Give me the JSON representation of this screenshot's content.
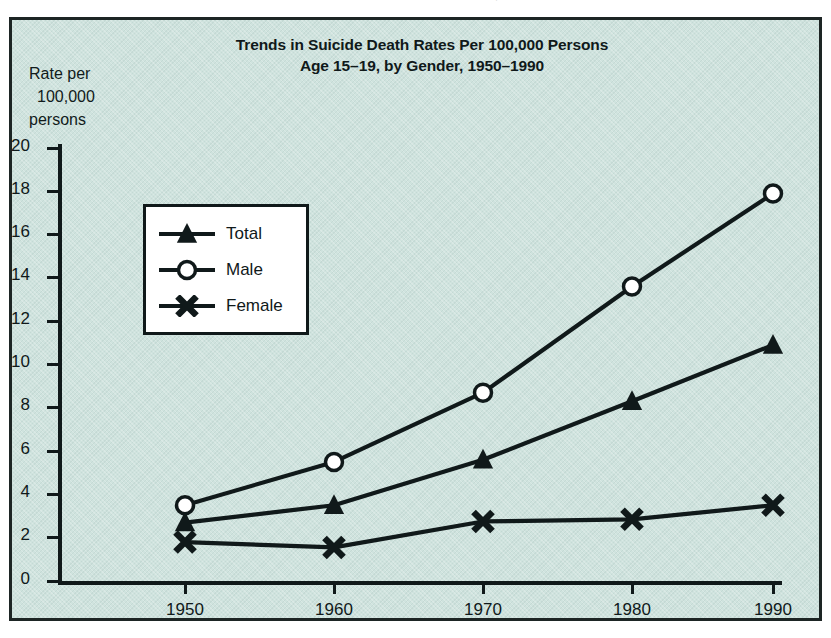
{
  "scan_artifact": {
    "ghost_text": "Trends in Suicide Death Rates Per 100,000 Persons"
  },
  "chart_panel": {
    "background_color": "#cfe3de",
    "border_color": "#1d2524",
    "legend_background": "#ffffff"
  },
  "y_caption": {
    "line1": "Rate per",
    "line2": "100,000",
    "line3": "persons"
  },
  "legend": {
    "items": [
      {
        "label": "Total",
        "marker": "filled-triangle-marker"
      },
      {
        "label": "Male",
        "marker": "open-circle-marker"
      },
      {
        "label": "Female",
        "marker": "cross-x-marker"
      }
    ]
  },
  "chart_data": {
    "type": "line",
    "title": "Trends in Suicide Death Rates Per 100,000 Persons",
    "subtitle": "Age 15–19, by Gender, 1950–1990",
    "xlabel": "",
    "ylabel": "Rate per 100,000 persons",
    "x": [
      1950,
      1960,
      1970,
      1980,
      1990
    ],
    "xtick_labels": [
      "1950",
      "1960",
      "1970",
      "1980",
      "1990"
    ],
    "ytick_labels": [
      "0",
      "2",
      "4",
      "6",
      "8",
      "10",
      "12",
      "14",
      "16",
      "18",
      "20"
    ],
    "yticks": [
      0,
      2,
      4,
      6,
      8,
      10,
      12,
      14,
      16,
      18,
      20
    ],
    "ylim": [
      0,
      20
    ],
    "xlim": [
      1945,
      1995
    ],
    "grid": false,
    "legend_position": "upper-left-inset",
    "series": [
      {
        "name": "Total",
        "values": [
          2.7,
          3.5,
          5.6,
          8.3,
          10.9
        ],
        "marker": "triangle",
        "color": "#10191a"
      },
      {
        "name": "Male",
        "values": [
          3.5,
          5.5,
          8.7,
          13.6,
          17.9
        ],
        "marker": "circle",
        "color": "#10191a"
      },
      {
        "name": "Female",
        "values": [
          1.8,
          1.55,
          2.75,
          2.85,
          3.5
        ],
        "marker": "x",
        "color": "#10191a"
      }
    ]
  }
}
